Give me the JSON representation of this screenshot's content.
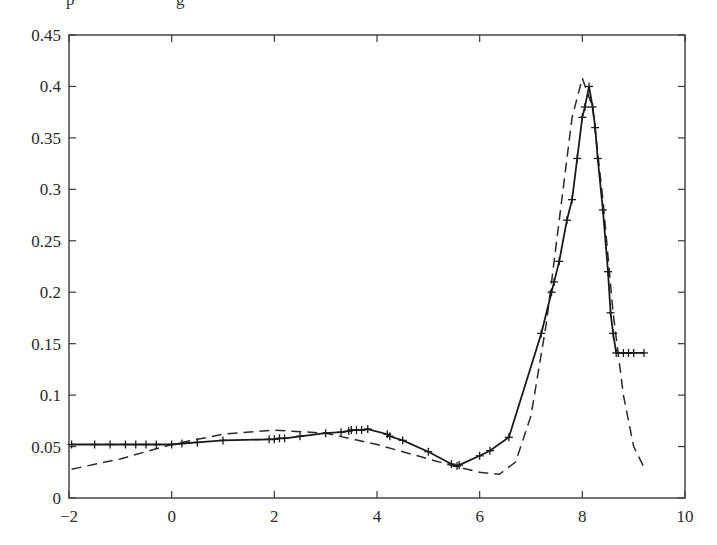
{
  "chart_data": {
    "type": "line",
    "title": "",
    "xlabel": "",
    "ylabel": "",
    "xlim": [
      -2,
      10
    ],
    "ylim": [
      0,
      0.45
    ],
    "grid": false,
    "legend": null,
    "x_ticks": [
      -2,
      0,
      2,
      4,
      6,
      8,
      10
    ],
    "x_tick_labels": [
      "−2",
      "0",
      "2",
      "4",
      "6",
      "8",
      "10"
    ],
    "y_ticks": [
      0,
      0.05,
      0.1,
      0.15,
      0.2,
      0.25,
      0.3,
      0.35,
      0.4,
      0.45
    ],
    "y_tick_labels": [
      "0",
      "0.05",
      "0.1",
      "0.15",
      "0.2",
      "0.25",
      "0.3",
      "0.35",
      "0.4",
      "0.45"
    ],
    "series": [
      {
        "name": "solid-with-plus-markers",
        "style": "solid",
        "marker": "+",
        "color": "#1a1a1a",
        "x": [
          -1.95,
          -1.5,
          -1.2,
          -0.9,
          -0.7,
          -0.5,
          -0.3,
          0.0,
          0.2,
          0.5,
          1.0,
          1.9,
          2.0,
          2.1,
          2.2,
          2.5,
          3.0,
          3.3,
          3.45,
          3.5,
          3.6,
          3.7,
          3.82,
          4.2,
          4.25,
          4.5,
          5.0,
          5.45,
          5.56,
          5.6,
          6.0,
          6.2,
          6.57,
          7.2,
          7.4,
          7.45,
          7.55,
          7.7,
          7.8,
          7.9,
          8.0,
          8.05,
          8.13,
          8.2,
          8.25,
          8.3,
          8.4,
          8.5,
          8.55,
          8.6,
          8.66,
          8.8,
          8.9,
          9.0,
          9.2
        ],
        "y": [
          0.052,
          0.052,
          0.052,
          0.052,
          0.052,
          0.052,
          0.052,
          0.052,
          0.053,
          0.054,
          0.056,
          0.057,
          0.057,
          0.058,
          0.058,
          0.06,
          0.063,
          0.064,
          0.065,
          0.066,
          0.066,
          0.066,
          0.067,
          0.062,
          0.06,
          0.056,
          0.045,
          0.033,
          0.031,
          0.032,
          0.041,
          0.046,
          0.059,
          0.16,
          0.2,
          0.21,
          0.23,
          0.27,
          0.29,
          0.33,
          0.37,
          0.38,
          0.4,
          0.38,
          0.36,
          0.33,
          0.28,
          0.22,
          0.18,
          0.16,
          0.141,
          0.141,
          0.141,
          0.141,
          0.141
        ]
      },
      {
        "name": "dashed-reference",
        "style": "dashed",
        "marker": "none",
        "color": "#2a2a2a",
        "x": [
          -1.95,
          -1.0,
          0.0,
          1.0,
          2.0,
          3.0,
          4.0,
          5.0,
          5.5,
          6.0,
          6.38,
          6.7,
          7.0,
          7.3,
          7.6,
          7.8,
          8.0,
          8.2,
          8.4,
          8.6,
          8.8,
          9.0,
          9.2
        ],
        "y": [
          0.028,
          0.038,
          0.052,
          0.062,
          0.066,
          0.063,
          0.052,
          0.038,
          0.031,
          0.025,
          0.023,
          0.035,
          0.08,
          0.17,
          0.29,
          0.37,
          0.408,
          0.38,
          0.29,
          0.18,
          0.1,
          0.05,
          0.03
        ]
      }
    ]
  },
  "top_cropped_text": "p … g"
}
